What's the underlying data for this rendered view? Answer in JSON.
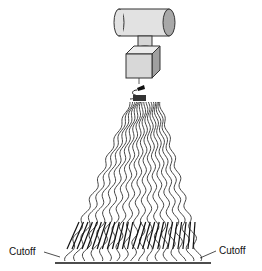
{
  "diagram": {
    "components": [
      {
        "name": "cylinder-motor",
        "shape": "horizontal cylinder"
      },
      {
        "name": "cube-housing",
        "shape": "cube"
      },
      {
        "name": "nozzle-tip",
        "shape": "small dark tip with hook"
      },
      {
        "name": "strand-fan",
        "shape": "fanning wavy lines"
      },
      {
        "name": "cut-marks",
        "shape": "dark slanted strokes"
      },
      {
        "name": "base-line",
        "shape": "horizontal line"
      }
    ],
    "labels": {
      "left": "Cutoff",
      "right": "Cutoff"
    },
    "colors": {
      "stroke": "#222222",
      "fill_light": "#e2e2e2",
      "fill_mid": "#c8c8c8",
      "fill_dark": "#9a9a9a",
      "background": "#ffffff"
    }
  }
}
